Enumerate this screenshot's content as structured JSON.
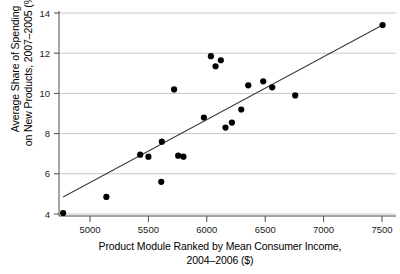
{
  "chart_data": {
    "type": "scatter",
    "title": "",
    "xlabel": "Product Module Ranked by Mean Consumer Income, 2004–2006 ($)",
    "xlabel_line1": "Product Module Ranked by Mean Consumer Income,",
    "xlabel_line2": "2004–2006 ($)",
    "ylabel": "Average Share of Spending on New Products, 2007–2005 (%)",
    "ylabel_line1": "Average Share of Spending",
    "ylabel_line2": "on New Products, 2007–2005 (%)",
    "xlim": [
      4700,
      7620
    ],
    "ylim": [
      3.6,
      14.35
    ],
    "xticks": [
      5000,
      5500,
      6000,
      6500,
      7000,
      7500
    ],
    "xtick_labels": [
      "5000",
      "5500",
      "6000",
      "6500",
      "7000",
      "7500"
    ],
    "yticks": [
      4,
      6,
      8,
      10,
      12,
      14
    ],
    "ytick_labels": [
      "4",
      "6",
      "8",
      "10",
      "12",
      "14"
    ],
    "grid": "horizontal",
    "legend": "none",
    "marker": "filled-circle",
    "marker_color": "#000000",
    "trendline_color": "#3d3d3d",
    "points": [
      {
        "x": 4770,
        "y": 4.05
      },
      {
        "x": 5140,
        "y": 4.85
      },
      {
        "x": 5430,
        "y": 6.95
      },
      {
        "x": 5500,
        "y": 6.85
      },
      {
        "x": 5610,
        "y": 5.6
      },
      {
        "x": 5615,
        "y": 7.6
      },
      {
        "x": 5720,
        "y": 10.2
      },
      {
        "x": 5755,
        "y": 6.9
      },
      {
        "x": 5800,
        "y": 6.85
      },
      {
        "x": 5975,
        "y": 8.8
      },
      {
        "x": 6035,
        "y": 11.85
      },
      {
        "x": 6075,
        "y": 11.35
      },
      {
        "x": 6120,
        "y": 11.65
      },
      {
        "x": 6160,
        "y": 8.3
      },
      {
        "x": 6215,
        "y": 8.55
      },
      {
        "x": 6295,
        "y": 9.2
      },
      {
        "x": 6355,
        "y": 10.4
      },
      {
        "x": 6483,
        "y": 10.6
      },
      {
        "x": 6560,
        "y": 10.3
      },
      {
        "x": 6757,
        "y": 9.9
      },
      {
        "x": 7505,
        "y": 13.4
      }
    ],
    "trendline": {
      "x1": 4770,
      "y1": 4.85,
      "x2": 7505,
      "y2": 13.4
    }
  }
}
